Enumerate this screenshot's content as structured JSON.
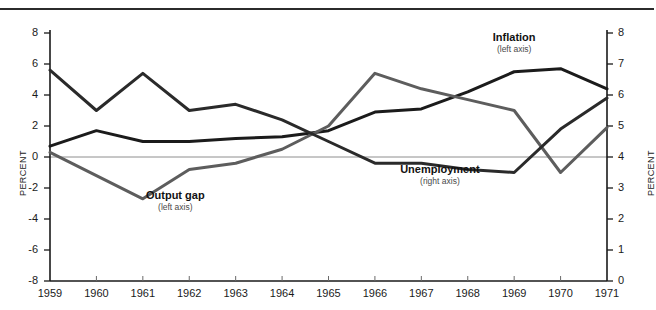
{
  "chart_data": {
    "type": "line",
    "title": "",
    "subtitle": "",
    "xlabel": "",
    "ylabel": "PERCENT",
    "ylabel_right": "PERCENT",
    "x": [
      1959,
      1960,
      1961,
      1962,
      1963,
      1964,
      1965,
      1966,
      1967,
      1968,
      1969,
      1970,
      1971
    ],
    "xtick_labels": [
      "1959",
      "1960",
      "1961",
      "1962",
      "1963",
      "1964",
      "1965",
      "1966",
      "1967",
      "1968",
      "1969",
      "1970",
      "1971"
    ],
    "xlim": [
      1959,
      1971
    ],
    "ylim": [
      -8,
      8
    ],
    "ytick_labels": [
      "8",
      "6",
      "4",
      "2",
      "0",
      "-2",
      "-4",
      "-6",
      "-8"
    ],
    "yticks": [
      8,
      6,
      4,
      2,
      0,
      -2,
      -4,
      -6,
      -8
    ],
    "ylim_right": [
      0,
      8
    ],
    "ytick_labels_right": [
      "8",
      "7",
      "6",
      "5",
      "4",
      "3",
      "2",
      "1",
      "0"
    ],
    "yticks_right": [
      8,
      7,
      6,
      5,
      4,
      3,
      2,
      1,
      0
    ],
    "grid": false,
    "zero_line": true,
    "legend_position": "inline-annotations",
    "series": [
      {
        "name": "Inflation",
        "axis": "left",
        "axis_note": "(left axis)",
        "color": "#1b1b1b",
        "values": [
          0.7,
          1.7,
          1.0,
          1.0,
          1.2,
          1.3,
          1.7,
          2.9,
          3.1,
          4.2,
          5.5,
          5.7,
          4.4
        ],
        "label_x": 1969.0,
        "label_y": 7.6
      },
      {
        "name": "Output gap",
        "axis": "left",
        "axis_note": "(left axis)",
        "color": "#5d5d5d",
        "values": [
          0.3,
          -1.2,
          -2.7,
          -0.8,
          -0.4,
          0.5,
          2.0,
          5.4,
          4.4,
          3.7,
          3.0,
          -1.0,
          1.9
        ],
        "label_x": 1961.7,
        "label_y": -2.6
      },
      {
        "name": "Unemployment",
        "axis": "right",
        "axis_note": "(right axis)",
        "color": "#2a2a2a",
        "values": [
          6.8,
          5.5,
          6.7,
          5.5,
          5.7,
          5.2,
          4.5,
          3.8,
          3.8,
          3.6,
          3.5,
          4.9,
          5.9
        ],
        "label_x": 1967.4,
        "label_y_right": 3.55
      }
    ]
  },
  "axis": {
    "left_title": "PERCENT",
    "right_title": "PERCENT"
  },
  "annotations": {
    "inflation": {
      "name": "Inflation",
      "axis_note": "(left axis)"
    },
    "output_gap": {
      "name": "Output gap",
      "axis_note": "(left axis)"
    },
    "unemployment": {
      "name": "Unemployment",
      "axis_note": "(right axis)"
    }
  }
}
